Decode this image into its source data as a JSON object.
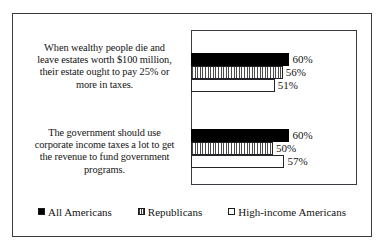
{
  "chart_data": {
    "type": "bar",
    "orientation": "horizontal",
    "title": "",
    "xlabel": "",
    "ylabel": "",
    "grid": false,
    "legend_position": "bottom",
    "xlim": [
      0,
      100
    ],
    "categories": [
      "When wealthy people die and leave estates worth $100 million, their estate ought to pay 25% or more in taxes.",
      "The government should use corporate income taxes a lot to get the revenue to fund government programs."
    ],
    "series": [
      {
        "name": "All Americans",
        "values": [
          60,
          60
        ],
        "labels": [
          "60%",
          "60%"
        ],
        "color": "#000000",
        "pattern": "solid"
      },
      {
        "name": "Republicans",
        "values": [
          56,
          50
        ],
        "labels": [
          "56%",
          "50%"
        ],
        "color": "#c9c9c9",
        "pattern": "vertical-stripes"
      },
      {
        "name": "High-income Americans",
        "values": [
          51,
          57
        ],
        "labels": [
          "51%",
          "57%"
        ],
        "color": "#ffffff",
        "pattern": "empty"
      }
    ]
  },
  "categories": {
    "lines": [
      [
        "When wealthy people die and",
        "leave estates worth $100 million,",
        "their estate ought to pay 25% or",
        "more in taxes."
      ],
      [
        "The government should use",
        "corporate income taxes a lot to get",
        "the revenue to fund government",
        "programs."
      ]
    ]
  },
  "legend": {
    "items": [
      {
        "label": "All Americans"
      },
      {
        "label": "Republicans"
      },
      {
        "label": "High-income Americans"
      }
    ]
  }
}
